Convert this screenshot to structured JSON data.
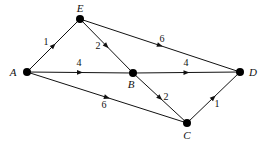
{
  "diagram": {
    "type": "directed-weighted-graph",
    "colors": {
      "stroke": "#111111",
      "node": "#000000",
      "background": "#ffffff"
    },
    "nodes": [
      {
        "id": "A",
        "label": "A",
        "x": 27,
        "y": 72,
        "label_x": 13,
        "label_y": 72
      },
      {
        "id": "E",
        "label": "E",
        "x": 80,
        "y": 19,
        "label_x": 80,
        "label_y": 8
      },
      {
        "id": "B",
        "label": "B",
        "x": 133,
        "y": 73,
        "label_x": 131,
        "label_y": 84
      },
      {
        "id": "D",
        "label": "D",
        "x": 240,
        "y": 72,
        "label_x": 253,
        "label_y": 72
      },
      {
        "id": "C",
        "label": "C",
        "x": 187,
        "y": 123,
        "label_x": 187,
        "label_y": 135
      }
    ],
    "edges": [
      {
        "from": "A",
        "to": "E",
        "weight": "1",
        "label_x": 46,
        "label_y": 42
      },
      {
        "from": "E",
        "to": "B",
        "weight": "2",
        "label_x": 98,
        "label_y": 46
      },
      {
        "from": "E",
        "to": "D",
        "weight": "6",
        "label_x": 162,
        "label_y": 39
      },
      {
        "from": "A",
        "to": "B",
        "weight": "4",
        "label_x": 79,
        "label_y": 63
      },
      {
        "from": "B",
        "to": "D",
        "weight": "4",
        "label_x": 186,
        "label_y": 63
      },
      {
        "from": "A",
        "to": "C",
        "weight": "6",
        "label_x": 104,
        "label_y": 105
      },
      {
        "from": "B",
        "to": "C",
        "weight": "2",
        "label_x": 166,
        "label_y": 97
      },
      {
        "from": "C",
        "to": "D",
        "weight": "1",
        "label_x": 217,
        "label_y": 104
      }
    ]
  }
}
